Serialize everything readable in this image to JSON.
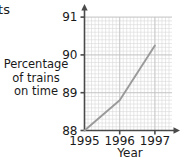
{
  "fragment": {
    "clipped_text": "ts"
  },
  "chart_data": {
    "type": "line",
    "title": "",
    "xlabel": "Year",
    "ylabel": "Percentage of trains on time",
    "ylabel_lines": [
      "Percentage",
      "of trains",
      "on time"
    ],
    "x": [
      1995,
      1996,
      1997
    ],
    "values": [
      88.0,
      88.8,
      90.25
    ],
    "series": [
      {
        "name": "Percentage of trains on time",
        "values": [
          88.0,
          88.8,
          90.25
        ],
        "color": "#9a9a9a"
      }
    ],
    "xticks": [
      "1995",
      "1996",
      "1997"
    ],
    "xtick_values": [
      1995,
      1996,
      1997
    ],
    "yticks": [
      "88",
      "89",
      "90",
      "91"
    ],
    "ytick_values": [
      88,
      89,
      90,
      91
    ],
    "xlim": [
      1995,
      1997.5
    ],
    "ylim": [
      88,
      91
    ],
    "grid": true,
    "grid_minor_per_unit": 10,
    "legend": "none",
    "axis_arrows": true,
    "colors": {
      "line": "#9a9a9a",
      "axis": "#4a4a4a",
      "grid_minor": "#d8d8d8",
      "grid_major": "#c2c2c2",
      "text": "#1a1a1a",
      "background": "#ffffff"
    }
  }
}
